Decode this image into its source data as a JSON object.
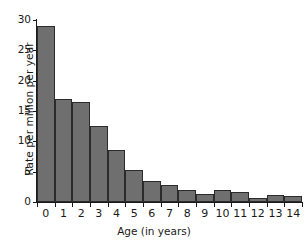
{
  "chart_data": {
    "type": "bar",
    "title": "",
    "xlabel": "Age (in years)",
    "ylabel": "Rate per million per year",
    "categories": [
      "0",
      "1",
      "2",
      "3",
      "4",
      "5",
      "6",
      "7",
      "8",
      "9",
      "10",
      "11",
      "12",
      "13",
      "14"
    ],
    "values": [
      29.0,
      17.0,
      16.5,
      12.5,
      8.6,
      5.3,
      3.5,
      2.8,
      2.0,
      1.3,
      2.0,
      1.7,
      0.6,
      1.2,
      1.0
    ],
    "ylim": [
      0,
      30
    ],
    "yticks": [
      0,
      5,
      10,
      15,
      20,
      25,
      30
    ],
    "yticklabels": [
      "0",
      "5",
      "10",
      "15",
      "20",
      "25",
      "30"
    ],
    "xlim": [
      0,
      15
    ],
    "grid": false,
    "legend": null,
    "bar_color": "#6f6f6f",
    "bar_edge_color": "#2b2b2b",
    "background_color": "#ffffff",
    "axis_color": "#1a1a1a"
  }
}
